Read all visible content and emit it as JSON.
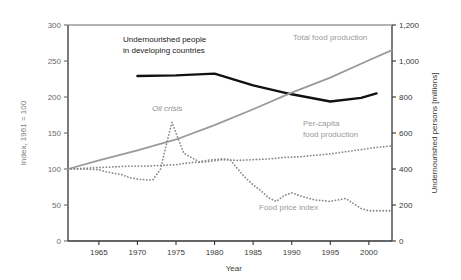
{
  "chart_data": {
    "type": "line",
    "title": "",
    "xlabel": "Year",
    "ylabel": "Index, 1961 = 100",
    "ylabel_right": "Undernourished persons [millions]",
    "xlim": [
      1961,
      2003
    ],
    "ylim": [
      0,
      300
    ],
    "ylim_right": [
      0,
      1200
    ],
    "xticks": [
      1965,
      1970,
      1975,
      1980,
      1985,
      1990,
      1995,
      2000
    ],
    "xtick_labels": [
      "1965",
      "1970",
      "1975",
      "1980",
      "1985",
      "1990",
      "1995",
      "2000"
    ],
    "yticks": [
      0,
      50,
      100,
      150,
      200,
      250,
      300
    ],
    "ytick_labels": [
      "0",
      "50",
      "100",
      "150",
      "200",
      "250",
      "300"
    ],
    "yticks_right": [
      0,
      200,
      400,
      600,
      800,
      1000,
      1200
    ],
    "ytick_labels_right": [
      "0",
      "200",
      "400",
      "600",
      "800",
      "1,000",
      "1,200"
    ],
    "grid": false,
    "legend": "inline-annotations",
    "series": [
      {
        "name": "Undernourished people in developing countries",
        "axis": "right",
        "style": "solid",
        "color": "#111111",
        "width": 2.4,
        "units": "millions",
        "points": [
          [
            1970,
            917
          ],
          [
            1975,
            920
          ],
          [
            1980,
            930
          ],
          [
            1985,
            865
          ],
          [
            1990,
            815
          ],
          [
            1995,
            775
          ],
          [
            1999,
            795
          ],
          [
            2001,
            820
          ]
        ]
      },
      {
        "name": "Total food production",
        "axis": "left",
        "style": "solid",
        "color": "#9a9a9a",
        "width": 1.8,
        "units": "index 1961=100",
        "points": [
          [
            1961,
            100
          ],
          [
            1965,
            112
          ],
          [
            1970,
            126
          ],
          [
            1975,
            141
          ],
          [
            1980,
            161
          ],
          [
            1985,
            183
          ],
          [
            1990,
            206
          ],
          [
            1995,
            227
          ],
          [
            2000,
            251
          ],
          [
            2003,
            265
          ]
        ]
      },
      {
        "name": "Per-capita food production",
        "axis": "left",
        "style": "dotted",
        "color": "#8a8a8a",
        "width": 1.8,
        "units": "index 1961=100",
        "points": [
          [
            1961,
            100
          ],
          [
            1963,
            101
          ],
          [
            1965,
            102
          ],
          [
            1967,
            103
          ],
          [
            1969,
            104
          ],
          [
            1971,
            104
          ],
          [
            1973,
            105
          ],
          [
            1975,
            106
          ],
          [
            1977,
            109
          ],
          [
            1979,
            110
          ],
          [
            1981,
            113
          ],
          [
            1983,
            112
          ],
          [
            1985,
            113
          ],
          [
            1987,
            114
          ],
          [
            1989,
            116
          ],
          [
            1991,
            117
          ],
          [
            1993,
            119
          ],
          [
            1995,
            121
          ],
          [
            1997,
            124
          ],
          [
            1999,
            127
          ],
          [
            2001,
            130
          ],
          [
            2003,
            132
          ]
        ]
      },
      {
        "name": "Food price index",
        "axis": "left",
        "style": "dotted",
        "color": "#8a8a8a",
        "width": 1.8,
        "units": "index 1961=100",
        "points": [
          [
            1961,
            100
          ],
          [
            1963,
            100
          ],
          [
            1965,
            99
          ],
          [
            1966,
            96
          ],
          [
            1967,
            94
          ],
          [
            1968,
            92
          ],
          [
            1969,
            88
          ],
          [
            1970,
            86
          ],
          [
            1971,
            85
          ],
          [
            1972,
            85
          ],
          [
            1973,
            100
          ],
          [
            1974,
            145
          ],
          [
            1974.5,
            165
          ],
          [
            1975,
            150
          ],
          [
            1976,
            122
          ],
          [
            1977,
            116
          ],
          [
            1978,
            110
          ],
          [
            1979,
            112
          ],
          [
            1980,
            113
          ],
          [
            1981,
            114
          ],
          [
            1982,
            113
          ],
          [
            1983,
            100
          ],
          [
            1984,
            88
          ],
          [
            1985,
            78
          ],
          [
            1986,
            70
          ],
          [
            1987,
            60
          ],
          [
            1988,
            55
          ],
          [
            1989,
            63
          ],
          [
            1990,
            67
          ],
          [
            1991,
            63
          ],
          [
            1992,
            60
          ],
          [
            1993,
            57
          ],
          [
            1994,
            56
          ],
          [
            1995,
            55
          ],
          [
            1996,
            57
          ],
          [
            1997,
            59
          ],
          [
            1998,
            52
          ],
          [
            1999,
            45
          ],
          [
            2000,
            42
          ],
          [
            2001,
            42
          ],
          [
            2002,
            42
          ],
          [
            2003,
            42
          ]
        ]
      }
    ],
    "annotations": [
      {
        "id": "undernourished-label",
        "lines": [
          "Undernourished people",
          "in developing countries"
        ],
        "color": "#1a1a1a",
        "x": 123,
        "y": 42,
        "anchor": "start",
        "italic": false
      },
      {
        "id": "total-food-production-label",
        "lines": [
          "Total food production"
        ],
        "color": "#9a9a9a",
        "x": 293,
        "y": 40,
        "anchor": "start",
        "italic": false
      },
      {
        "id": "per-capita-food-production-label",
        "lines": [
          "Per-capita",
          "food production"
        ],
        "color": "#9a9a9a",
        "x": 303,
        "y": 126,
        "anchor": "start",
        "italic": false
      },
      {
        "id": "food-price-index-label",
        "lines": [
          "Food price index"
        ],
        "color": "#9a9a9a",
        "x": 259,
        "y": 210,
        "anchor": "start",
        "italic": false
      },
      {
        "id": "oil-crisis-label",
        "lines": [
          "Oil crisis"
        ],
        "color": "#8f8f8f",
        "x": 152,
        "y": 111,
        "anchor": "start",
        "italic": true
      }
    ]
  }
}
